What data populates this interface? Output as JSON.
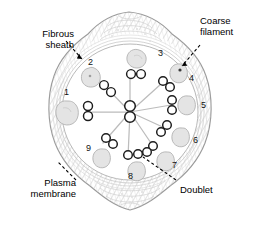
{
  "figure": {
    "type": "biological-diagram",
    "colors": {
      "outline": "#9a9a9a",
      "sheath_hatch": "#bdbdbd",
      "doublet_stroke": "#1a1a1a",
      "coarse_filament_fill": "#e2e2e2",
      "coarse_filament_stroke": "#b0b0b0",
      "spoke": "#b5b5b5",
      "label_text": "#000000",
      "leader": "#000000",
      "background": "#ffffff"
    }
  },
  "callouts": [
    {
      "id": "fibrous-sheath",
      "line1": "Fibrous",
      "line2": "sheath",
      "position": "top-left"
    },
    {
      "id": "coarse-filament",
      "line1": "Coarse",
      "line2": "filament",
      "position": "top-right"
    },
    {
      "id": "plasma-membrane",
      "line1": "Plasma",
      "line2": "membrane",
      "position": "bottom-left"
    },
    {
      "id": "doublet",
      "line1": "Doublet",
      "line2": "",
      "position": "bottom-right"
    }
  ],
  "doublets": [
    {
      "number": "1",
      "angle_deg": 180,
      "label_x": 64,
      "label_y": 88
    },
    {
      "number": "2",
      "angle_deg": 220,
      "label_x": 88,
      "label_y": 61
    },
    {
      "number": "3",
      "angle_deg": 270,
      "label_x": 158,
      "label_y": 50
    },
    {
      "number": "4",
      "angle_deg": 310,
      "label_x": 186,
      "label_y": 74
    },
    {
      "number": "5",
      "angle_deg": 340,
      "label_x": 198,
      "label_y": 101
    },
    {
      "number": "6",
      "angle_deg": 20,
      "label_x": 191,
      "label_y": 138
    },
    {
      "number": "7",
      "angle_deg": 52,
      "label_x": 171,
      "label_y": 162
    },
    {
      "number": "8",
      "angle_deg": 90,
      "label_x": 127,
      "label_y": 168
    },
    {
      "number": "9",
      "angle_deg": 140,
      "label_x": 86,
      "label_y": 143
    }
  ],
  "central_pair": {
    "name": "central-pair",
    "orientation": "vertical"
  },
  "counts": {
    "outer_doublets": 9,
    "central_singlets": 2,
    "coarse_filaments": 9
  }
}
